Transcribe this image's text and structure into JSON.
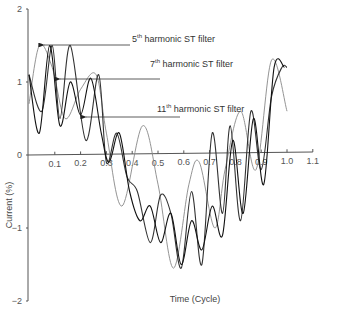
{
  "chart_data": {
    "type": "line",
    "title": "",
    "xlabel": "Time (Cycle)",
    "ylabel": "Current (%)",
    "xlim": [
      0,
      1.1
    ],
    "ylim": [
      -2,
      2
    ],
    "x_ticks": [
      "0.1",
      "0.2",
      "0.3",
      "0.4",
      "0.5",
      "0.6",
      "0.7",
      "0.8",
      "0.9",
      "1.0",
      "1.1"
    ],
    "y_ticks": [
      "2",
      "1",
      "0",
      "-1",
      "-2"
    ],
    "grid": false,
    "legend": "annotations with arrows",
    "annotations": [
      {
        "base": "5",
        "sup": "th",
        "text": " harmonic ST filter"
      },
      {
        "base": "7",
        "sup": "th",
        "text": " harmonic ST filter"
      },
      {
        "base": "11",
        "sup": "th",
        "text": " harmonic ST filter"
      }
    ],
    "series": [
      {
        "name": "5th harmonic ST filter",
        "color": "#888888",
        "x": [
          0,
          0.04,
          0.09,
          0.14,
          0.2,
          0.26,
          0.3,
          0.36,
          0.44,
          0.5,
          0.56,
          0.62,
          0.66,
          0.72,
          0.76,
          0.82,
          0.88,
          0.94,
          1.0
        ],
        "y": [
          0.7,
          1.5,
          1.2,
          0.5,
          0.9,
          1.1,
          0.3,
          -0.7,
          0.4,
          -0.4,
          -1.55,
          -0.4,
          -0.1,
          -1.0,
          -0.2,
          0.6,
          -0.2,
          1.3,
          0.6
        ]
      },
      {
        "name": "7th harmonic ST filter",
        "color": "#333333",
        "x": [
          0,
          0.05,
          0.09,
          0.12,
          0.16,
          0.22,
          0.27,
          0.3,
          0.34,
          0.38,
          0.42,
          0.47,
          0.51,
          0.55,
          0.59,
          0.63,
          0.67,
          0.71,
          0.75,
          0.78,
          0.82,
          0.86,
          0.9,
          0.94,
          0.98,
          1.0
        ],
        "y": [
          1.1,
          0.6,
          1.5,
          0.5,
          1.5,
          0.2,
          1.1,
          -0.1,
          0.3,
          -0.3,
          -0.5,
          -1.2,
          -0.55,
          -0.8,
          -1.55,
          -0.5,
          -1.5,
          0.3,
          -0.8,
          0.4,
          -0.9,
          0.6,
          -0.2,
          0.8,
          1.2,
          1.2
        ]
      },
      {
        "name": "11th harmonic ST filter",
        "color": "#111111",
        "x": [
          0,
          0.04,
          0.08,
          0.12,
          0.16,
          0.2,
          0.24,
          0.28,
          0.31,
          0.35,
          0.39,
          0.43,
          0.47,
          0.51,
          0.55,
          0.59,
          0.63,
          0.67,
          0.71,
          0.75,
          0.79,
          0.83,
          0.87,
          0.91,
          0.95,
          0.99
        ],
        "y": [
          1.1,
          0.3,
          1.5,
          0.4,
          1.0,
          0.55,
          1.05,
          0.3,
          -0.1,
          0.3,
          -0.5,
          -0.9,
          -0.7,
          -1.2,
          -0.8,
          -1.5,
          -0.9,
          -1.3,
          -0.7,
          -1.1,
          0.2,
          -0.8,
          0.5,
          -0.4,
          1.2,
          1.2
        ]
      }
    ]
  }
}
